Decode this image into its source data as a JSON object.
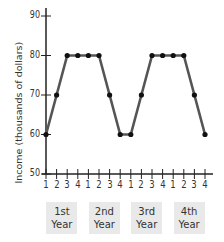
{
  "chart_data": {
    "type": "line",
    "title": "",
    "xlabel": "",
    "ylabel": "Income (thousands of dollars)",
    "ylim": [
      50,
      90
    ],
    "yticks": [
      50,
      60,
      70,
      80,
      90
    ],
    "grid": false,
    "categories": [
      "1",
      "2",
      "3",
      "4",
      "1",
      "2",
      "3",
      "4",
      "1",
      "2",
      "3",
      "4",
      "1",
      "2",
      "3",
      "4"
    ],
    "year_groups": [
      {
        "line1": "1st",
        "line2": "Year"
      },
      {
        "line1": "2nd",
        "line2": "Year"
      },
      {
        "line1": "3rd",
        "line2": "Year"
      },
      {
        "line1": "4th",
        "line2": "Year"
      }
    ],
    "series": [
      {
        "name": "Income",
        "values": [
          60,
          70,
          80,
          80,
          80,
          80,
          70,
          60,
          60,
          70,
          80,
          80,
          80,
          80,
          70,
          60
        ]
      }
    ],
    "colors": {
      "line": "#555555",
      "marker": "#111111",
      "axis": "#222222",
      "year_box": "#e9e9e9"
    }
  }
}
